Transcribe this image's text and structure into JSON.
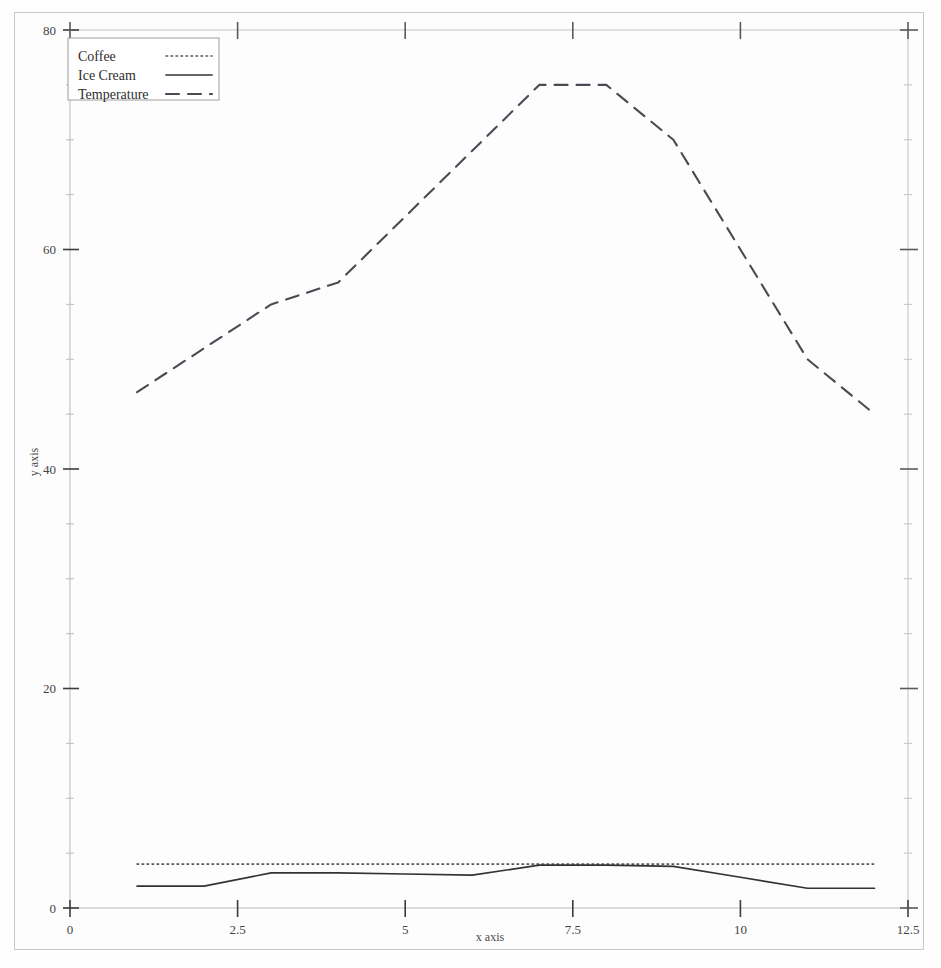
{
  "chart_data": {
    "type": "line",
    "title": "",
    "xlabel": "x axis",
    "ylabel": "y axis",
    "xlim": [
      0,
      12.5
    ],
    "ylim": [
      0,
      80
    ],
    "xticks": [
      "0",
      "2.5",
      "5",
      "7.5",
      "10",
      "12.5"
    ],
    "xtick_values": [
      0,
      2.5,
      5,
      7.5,
      10,
      12.5
    ],
    "yticks": [
      "0",
      "20",
      "40",
      "60",
      "80"
    ],
    "ytick_values": [
      0,
      20,
      40,
      60,
      80
    ],
    "grid": false,
    "legend_position": "upper left",
    "x": [
      1,
      2,
      3,
      4,
      5,
      6,
      7,
      8,
      9,
      10,
      11,
      12
    ],
    "series": [
      {
        "name": "Coffee",
        "style": "dotted",
        "color": "#555555",
        "values": [
          4,
          4,
          4,
          4,
          4,
          4,
          4,
          4,
          4,
          4,
          4,
          4
        ]
      },
      {
        "name": "Ice Cream",
        "style": "solid",
        "color": "#333333",
        "values": [
          2,
          2,
          3.2,
          3.2,
          3.1,
          3,
          3.9,
          3.9,
          3.8,
          2.8,
          1.8,
          1.8
        ]
      },
      {
        "name": "Temperature",
        "style": "dashed",
        "color": "#4a4a55",
        "values": [
          47,
          51,
          55,
          57,
          63,
          69,
          75,
          75,
          70,
          60,
          50,
          45
        ]
      }
    ]
  },
  "axes": {
    "x_axis_label": "x axis",
    "y_axis_label": "y axis"
  },
  "legend": {
    "entries": [
      {
        "label": "Coffee",
        "sample": "dotted"
      },
      {
        "label": "Ice Cream",
        "sample": "solid"
      },
      {
        "label": "Temperature",
        "sample": "dashed"
      }
    ]
  }
}
